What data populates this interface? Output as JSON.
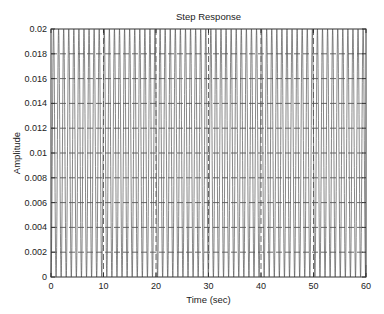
{
  "chart_data": {
    "type": "line",
    "title": "Step Response",
    "xlabel": "Time (sec)",
    "ylabel": "Amplitude",
    "xlim": [
      0,
      60
    ],
    "ylim": [
      0,
      0.02
    ],
    "xticks": [
      0,
      10,
      20,
      30,
      40,
      50,
      60
    ],
    "xtick_labels": [
      "0",
      "10",
      "20",
      "30",
      "40",
      "50",
      "60"
    ],
    "yticks": [
      0,
      0.002,
      0.004,
      0.006,
      0.008,
      0.01,
      0.012,
      0.014,
      0.016,
      0.018,
      0.02
    ],
    "ytick_labels": [
      "0",
      "0.002",
      "0.004",
      "0.006",
      "0.008",
      "0.01",
      "0.012",
      "0.014",
      "0.016",
      "0.018",
      "0.02"
    ],
    "grid": true,
    "legend": "none",
    "series": [
      {
        "name": "step response",
        "description": "Undamped oscillation y(t) = A(1 - cos(w t)) between 0 and 0.02",
        "amplitude": 0.01,
        "omega_rad_per_sec": 6.5,
        "t_start": 0,
        "t_end": 60,
        "color": "#555555"
      }
    ]
  }
}
